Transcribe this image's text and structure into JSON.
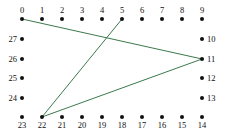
{
  "figure": {
    "kind": "cycle-graph-with-chords",
    "width": 229,
    "height": 137,
    "background_color": "#ffffff",
    "node_color": "#111111",
    "label_color": "#111111",
    "edge_color": "#3b7a4b",
    "edge_width": 1
  },
  "nodes": [
    {
      "label": "0",
      "x": 22,
      "y": 19,
      "label_pos": "top"
    },
    {
      "label": "1",
      "x": 42,
      "y": 19,
      "label_pos": "top"
    },
    {
      "label": "2",
      "x": 62,
      "y": 19,
      "label_pos": "top"
    },
    {
      "label": "3",
      "x": 82,
      "y": 19,
      "label_pos": "top"
    },
    {
      "label": "4",
      "x": 102,
      "y": 19,
      "label_pos": "top"
    },
    {
      "label": "5",
      "x": 122,
      "y": 19,
      "label_pos": "top"
    },
    {
      "label": "6",
      "x": 142,
      "y": 19,
      "label_pos": "top"
    },
    {
      "label": "7",
      "x": 162,
      "y": 19,
      "label_pos": "top"
    },
    {
      "label": "8",
      "x": 182,
      "y": 19,
      "label_pos": "top"
    },
    {
      "label": "9",
      "x": 202,
      "y": 19,
      "label_pos": "top"
    },
    {
      "label": "10",
      "x": 202,
      "y": 39,
      "label_pos": "right"
    },
    {
      "label": "11",
      "x": 202,
      "y": 59,
      "label_pos": "right"
    },
    {
      "label": "12",
      "x": 202,
      "y": 78,
      "label_pos": "right"
    },
    {
      "label": "13",
      "x": 202,
      "y": 98,
      "label_pos": "right"
    },
    {
      "label": "14",
      "x": 202,
      "y": 117,
      "label_pos": "bottom"
    },
    {
      "label": "15",
      "x": 182,
      "y": 117,
      "label_pos": "bottom"
    },
    {
      "label": "16",
      "x": 162,
      "y": 117,
      "label_pos": "bottom"
    },
    {
      "label": "17",
      "x": 142,
      "y": 117,
      "label_pos": "bottom"
    },
    {
      "label": "18",
      "x": 122,
      "y": 117,
      "label_pos": "bottom"
    },
    {
      "label": "19",
      "x": 102,
      "y": 117,
      "label_pos": "bottom"
    },
    {
      "label": "20",
      "x": 82,
      "y": 117,
      "label_pos": "bottom"
    },
    {
      "label": "21",
      "x": 62,
      "y": 117,
      "label_pos": "bottom"
    },
    {
      "label": "22",
      "x": 42,
      "y": 117,
      "label_pos": "bottom"
    },
    {
      "label": "23",
      "x": 22,
      "y": 117,
      "label_pos": "bottom"
    },
    {
      "label": "24",
      "x": 22,
      "y": 98,
      "label_pos": "left"
    },
    {
      "label": "25",
      "x": 22,
      "y": 78,
      "label_pos": "left"
    },
    {
      "label": "26",
      "x": 22,
      "y": 59,
      "label_pos": "left"
    },
    {
      "label": "27",
      "x": 22,
      "y": 39,
      "label_pos": "left"
    }
  ],
  "edges": [
    {
      "from": "0",
      "to": "11",
      "x1": 22,
      "y1": 19,
      "x2": 202,
      "y2": 59
    },
    {
      "from": "5",
      "to": "22",
      "x1": 122,
      "y1": 19,
      "x2": 42,
      "y2": 117
    },
    {
      "from": "11",
      "to": "22",
      "x1": 202,
      "y1": 59,
      "x2": 42,
      "y2": 117
    }
  ]
}
